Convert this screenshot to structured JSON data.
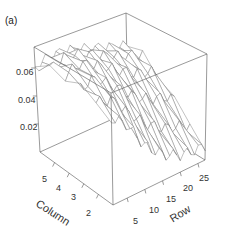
{
  "panel_label": "(a)",
  "chart_data": {
    "type": "surface3d",
    "title": "",
    "panel_label": "(a)",
    "xlabel": "Row",
    "ylabel": "Column",
    "zlabel": "",
    "x_ticks": [
      "5",
      "10",
      "15",
      "20",
      "25"
    ],
    "y_ticks": [
      "2",
      "3",
      "4",
      "5"
    ],
    "z_ticks": [
      "0.02",
      "0.04",
      "0.06"
    ],
    "x_range": [
      1,
      27
    ],
    "y_range": [
      1,
      6
    ],
    "z_range": [
      0.0,
      0.075
    ],
    "grid": false,
    "style": "wireframe perspective box",
    "surface_sample": {
      "rows": [
        1,
        5,
        10,
        15,
        20,
        25,
        27
      ],
      "columns": [
        1,
        2,
        3,
        4,
        5,
        6
      ],
      "z": [
        [
          0.058,
          0.062,
          0.066,
          0.068,
          0.066,
          0.06
        ],
        [
          0.05,
          0.06,
          0.068,
          0.072,
          0.07,
          0.064
        ],
        [
          0.03,
          0.045,
          0.058,
          0.066,
          0.068,
          0.064
        ],
        [
          0.018,
          0.032,
          0.046,
          0.058,
          0.062,
          0.06
        ],
        [
          0.012,
          0.024,
          0.038,
          0.05,
          0.056,
          0.056
        ],
        [
          0.01,
          0.02,
          0.034,
          0.046,
          0.052,
          0.052
        ],
        [
          0.01,
          0.018,
          0.03,
          0.042,
          0.05,
          0.05
        ]
      ]
    }
  },
  "axes": {
    "z_ticks": [
      {
        "label": "0.06",
        "x": 2,
        "y": 68
      },
      {
        "label": "0.04",
        "x": 2,
        "y": 96
      },
      {
        "label": "0.02",
        "x": 4,
        "y": 123
      }
    ],
    "column_ticks": [
      {
        "label": "5",
        "x": 43,
        "y": 174
      },
      {
        "label": "4",
        "x": 57,
        "y": 183
      },
      {
        "label": "3",
        "x": 72,
        "y": 191
      },
      {
        "label": "2",
        "x": 86,
        "y": 200
      }
    ],
    "row_ticks": [
      {
        "label": "5",
        "x": 131,
        "y": 216
      },
      {
        "label": "10",
        "x": 150,
        "y": 206
      },
      {
        "label": "15",
        "x": 168,
        "y": 196
      },
      {
        "label": "20",
        "x": 185,
        "y": 185
      },
      {
        "label": "25",
        "x": 200,
        "y": 174
      }
    ],
    "column_title": "Column",
    "row_title": "Row"
  }
}
